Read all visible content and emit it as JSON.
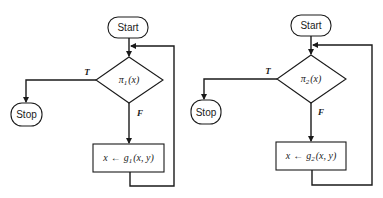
{
  "diagrams": [
    {
      "id": "flowchart-1",
      "start_label": "Start",
      "stop_label": "Stop",
      "decision": {
        "symbol": "π",
        "subscript": "1",
        "arg": "(x)"
      },
      "process": {
        "lhs": "x",
        "arrow": "←",
        "fn": "g",
        "subscript": "1",
        "args": "(x, y)"
      },
      "true_label": "T",
      "false_label": "F"
    },
    {
      "id": "flowchart-2",
      "start_label": "Start",
      "stop_label": "Stop",
      "decision": {
        "symbol": "π",
        "subscript": "2",
        "arg": "(x)"
      },
      "process": {
        "lhs": "x",
        "arrow": "←",
        "fn": "g",
        "subscript": "2",
        "args": "(x, y)"
      },
      "true_label": "T",
      "false_label": "F"
    }
  ]
}
